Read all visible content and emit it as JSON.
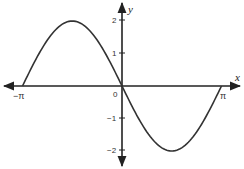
{
  "chart_data": {
    "type": "line",
    "title": "",
    "function": "y = -2 sin(x)",
    "xlabel": "x",
    "ylabel": "y",
    "xlim": [
      -3.14159,
      3.14159
    ],
    "ylim": [
      -2,
      2
    ],
    "grid": false,
    "legend": null,
    "x_ticks": [
      {
        "value": -3.14159,
        "label": "−π"
      },
      {
        "value": 0,
        "label": "0"
      },
      {
        "value": 3.14159,
        "label": "π"
      }
    ],
    "y_ticks": [
      {
        "value": 2,
        "label": "2"
      },
      {
        "value": 1,
        "label": "1"
      },
      {
        "value": -1,
        "label": "−1"
      },
      {
        "value": -2,
        "label": "−2"
      }
    ],
    "series": [
      {
        "name": "y = -2 sin(x)",
        "x": [
          -3.14159,
          -2.35619,
          -1.5708,
          -0.7854,
          0,
          0.7854,
          1.5708,
          2.35619,
          3.14159
        ],
        "y": [
          0,
          1.414,
          2,
          1.414,
          0,
          -1.414,
          -2,
          -1.414,
          0
        ]
      }
    ],
    "key_points": [
      {
        "label": "maximum",
        "x": -1.5708,
        "y": 2
      },
      {
        "label": "minimum",
        "x": 1.5708,
        "y": -2
      },
      {
        "label": "zeros",
        "x": [
          -3.14159,
          0,
          3.14159
        ],
        "y": 0
      }
    ],
    "colors": {
      "curve": "#333333",
      "axes": "#222222",
      "background": "#ffffff"
    }
  }
}
